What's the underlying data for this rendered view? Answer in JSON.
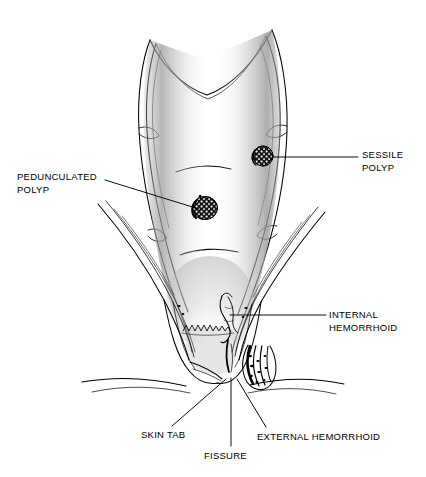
{
  "figure": {
    "background_color": "#ffffff",
    "ink_color": "#000000",
    "shading_color": "#8a8a8a"
  },
  "labels": {
    "sessile_polyp": {
      "line1": "SESSILE",
      "line2": "POLYP"
    },
    "pedunculated_polyp": {
      "line1": "PEDUNCULATED",
      "line2": "POLYP"
    },
    "internal_hemorrhoid": {
      "line1": "INTERNAL",
      "line2": "HEMORRHOID"
    },
    "skin_tab": {
      "line1": "SKIN TAB"
    },
    "fissure": {
      "line1": "FISSURE"
    },
    "external_hemorrhoid": {
      "line1": "EXTERNAL HEMORRHOID"
    }
  },
  "structures": [
    {
      "name": "rectal-wall",
      "description": "cut-open rectal ampulla with shaded mucosal surface"
    },
    {
      "name": "sessile-polyp",
      "description": "broad-based dark mulberry mass on right rectal wall"
    },
    {
      "name": "pedunculated-polyp",
      "description": "stalked dark mulberry mass on left rectal wall"
    },
    {
      "name": "dentate-line",
      "description": "zigzag mucocutaneous junction"
    },
    {
      "name": "internal-hemorrhoid",
      "description": "submucosal vascular cushion above dentate line"
    },
    {
      "name": "external-hemorrhoid",
      "description": "dark thrombosed vein bundle below anal verge"
    },
    {
      "name": "anal-fissure",
      "description": "vertical tear at posterior anal verge"
    },
    {
      "name": "skin-tag",
      "description": "perianal skin fold"
    },
    {
      "name": "levator-ani-left",
      "description": "left pelvic floor muscle sling"
    },
    {
      "name": "levator-ani-right",
      "description": "right pelvic floor muscle sling"
    },
    {
      "name": "sphincter-complex",
      "description": "internal and external anal sphincter bundles"
    }
  ],
  "leader_lines": [
    {
      "name": "sessile-polyp-leader",
      "from": [
        272,
        157
      ],
      "to": [
        358,
        157
      ]
    },
    {
      "name": "pedunculated-polyp-leader",
      "from": [
        105,
        180
      ],
      "to": [
        199,
        209
      ]
    },
    {
      "name": "internal-hemorrhoid-leader",
      "from": [
        230,
        315
      ],
      "to": [
        326,
        315
      ]
    },
    {
      "name": "skin-tab-leader",
      "from": [
        226,
        379
      ],
      "to": [
        172,
        426
      ]
    },
    {
      "name": "fissure-leader",
      "from": [
        231,
        378
      ],
      "to": [
        231,
        446
      ]
    },
    {
      "name": "external-hemorrhoid-leader",
      "from": [
        237,
        379
      ],
      "to": [
        266,
        427
      ]
    }
  ]
}
